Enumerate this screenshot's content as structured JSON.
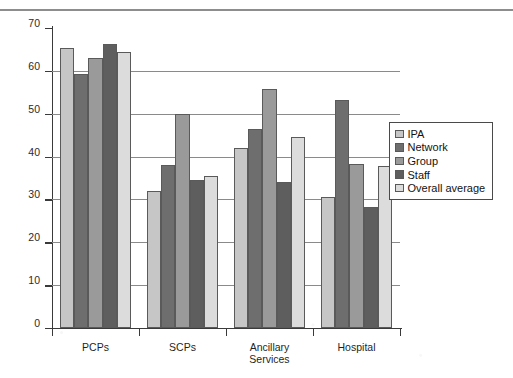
{
  "chart_data": {
    "type": "bar",
    "title": "",
    "xlabel": "",
    "ylabel": "",
    "ylim": [
      0,
      70
    ],
    "yticks": [
      0,
      10,
      20,
      30,
      40,
      50,
      60,
      70
    ],
    "ytick_labels": [
      "0",
      "10",
      "20",
      "30",
      "40",
      "50",
      "60",
      "70"
    ],
    "grid": "horizontal",
    "legend_position": "right",
    "categories": [
      "PCPs",
      "SCPs",
      "Ancillary Services",
      "Hospital"
    ],
    "category_labels": [
      [
        "PCPs"
      ],
      [
        "SCPs"
      ],
      [
        "Ancillary",
        "Services"
      ],
      [
        "Hospital"
      ]
    ],
    "series": [
      {
        "name": "IPA",
        "color": "#c6c6c6",
        "values": [
          65.3,
          32.0,
          42.0,
          30.5
        ]
      },
      {
        "name": "Network",
        "color": "#6e6e6e",
        "values": [
          59.3,
          38.0,
          46.5,
          53.3
        ]
      },
      {
        "name": "Group",
        "color": "#9a9a9a",
        "values": [
          63.0,
          50.0,
          55.8,
          38.3
        ]
      },
      {
        "name": "Staff",
        "color": "#5e5e5e",
        "values": [
          66.3,
          34.5,
          34.0,
          28.3
        ]
      },
      {
        "name": "Overall average",
        "color": "#dcdcdc",
        "values": [
          64.3,
          35.5,
          44.5,
          37.8
        ]
      }
    ]
  },
  "legend": {
    "items": [
      {
        "label": "IPA"
      },
      {
        "label": "Network"
      },
      {
        "label": "Group"
      },
      {
        "label": "Staff"
      },
      {
        "label": "Overall average"
      }
    ]
  },
  "page": {
    "top_rule": "",
    "bottom_text_fragment": ""
  }
}
